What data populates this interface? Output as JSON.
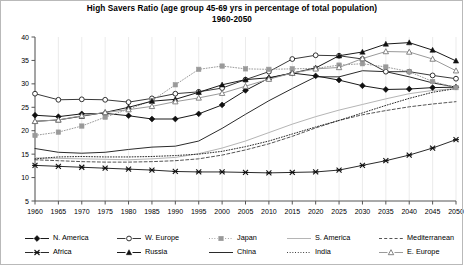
{
  "chart": {
    "title_line1": "High Savers Ratio (age group 45-69 yrs in percentage of total population)",
    "title_line2": "1960-2050"
  },
  "chart_data": {
    "type": "line",
    "title": "High Savers Ratio (age group 45-69 yrs in percentage of total population) 1960-2050",
    "xlabel": "",
    "ylabel": "",
    "xlim": [
      1960,
      2050
    ],
    "ylim": [
      5,
      40
    ],
    "yticks": [
      5,
      10,
      15,
      20,
      25,
      30,
      35,
      40
    ],
    "grid": true,
    "legend_position": "bottom",
    "categories": [
      1960,
      1965,
      1970,
      1975,
      1980,
      1985,
      1990,
      1995,
      2000,
      2005,
      2010,
      2015,
      2020,
      2025,
      2030,
      2035,
      2040,
      2045,
      2050
    ],
    "x": [
      1960,
      1965,
      1970,
      1975,
      1980,
      1985,
      1990,
      1995,
      2000,
      2005,
      2010,
      2015,
      2020,
      2025,
      2030,
      2035,
      2040,
      2045,
      2050
    ],
    "series": [
      {
        "name": "N. America",
        "marker": "filled-diamond",
        "color": "#1a1a1a",
        "style": "solid",
        "values": [
          23.3,
          23.0,
          23.6,
          23.7,
          23.2,
          22.5,
          22.5,
          23.6,
          25.5,
          28.6,
          31.2,
          32.3,
          31.7,
          30.8,
          29.6,
          28.8,
          28.9,
          29.2,
          29.3
        ]
      },
      {
        "name": "W. Europe",
        "marker": "open-circle",
        "color": "#3a3a3a",
        "style": "solid",
        "values": [
          27.9,
          26.6,
          26.7,
          26.6,
          26.1,
          26.9,
          27.9,
          28.3,
          29.1,
          30.9,
          32.6,
          35.3,
          36.1,
          36.0,
          35.3,
          32.6,
          32.6,
          31.8,
          31.1
        ]
      },
      {
        "name": "Japan",
        "marker": "filled-square",
        "color": "#9a9a9a",
        "style": "dotted",
        "values": [
          19.0,
          19.7,
          21.0,
          22.9,
          24.6,
          26.4,
          29.8,
          33.1,
          33.8,
          33.2,
          33.1,
          33.2,
          33.3,
          34.0,
          34.3,
          33.6,
          32.6,
          30.5,
          29.2
        ]
      },
      {
        "name": "S. America",
        "marker": "none",
        "color": "#b5b5b5",
        "style": "solid",
        "values": [
          14.2,
          14.1,
          14.0,
          13.9,
          13.8,
          14.0,
          14.3,
          15.1,
          16.3,
          17.8,
          19.6,
          21.4,
          23.0,
          24.4,
          25.6,
          26.8,
          27.9,
          28.6,
          29.0
        ]
      },
      {
        "name": "Mediterranean",
        "marker": "none",
        "color": "#555555",
        "style": "dashed",
        "values": [
          13.8,
          13.6,
          13.4,
          13.3,
          13.3,
          13.4,
          13.6,
          14.0,
          14.8,
          15.9,
          17.2,
          18.8,
          20.6,
          22.2,
          23.4,
          24.3,
          25.1,
          25.7,
          26.2
        ]
      },
      {
        "name": "Africa",
        "marker": "cross-x",
        "color": "#2b2b2b",
        "style": "solid",
        "values": [
          12.6,
          12.4,
          12.2,
          12.0,
          11.8,
          11.6,
          11.3,
          11.2,
          11.2,
          11.1,
          11.0,
          11.1,
          11.2,
          11.6,
          12.6,
          13.6,
          14.8,
          16.3,
          18.1
        ]
      },
      {
        "name": "Russia",
        "marker": "filled-triangle",
        "color": "#1a1a1a",
        "style": "solid",
        "values": [
          22.0,
          22.3,
          23.1,
          23.9,
          25.0,
          26.3,
          26.7,
          28.2,
          29.8,
          30.9,
          31.3,
          32.3,
          33.4,
          36.0,
          36.8,
          38.5,
          38.8,
          37.2,
          34.9
        ]
      },
      {
        "name": "China",
        "marker": "none",
        "color": "#2b2b2b",
        "style": "solid",
        "values": [
          16.2,
          15.4,
          15.2,
          15.4,
          16.0,
          16.5,
          16.7,
          17.8,
          20.5,
          23.5,
          26.4,
          29.0,
          31.5,
          31.5,
          32.8,
          32.6,
          31.5,
          30.2,
          29.3
        ]
      },
      {
        "name": "India",
        "marker": "none",
        "color": "#2b2b2b",
        "style": "dotted",
        "values": [
          14.0,
          14.4,
          14.5,
          14.4,
          14.4,
          14.5,
          14.7,
          15.0,
          15.6,
          16.6,
          17.8,
          19.3,
          20.8,
          22.2,
          23.8,
          25.4,
          26.9,
          28.2,
          29.0
        ]
      },
      {
        "name": "E. Europe",
        "marker": "open-triangle",
        "color": "#9a9a9a",
        "style": "solid",
        "values": [
          22.0,
          22.3,
          23.2,
          23.9,
          24.5,
          25.2,
          26.2,
          27.0,
          28.0,
          29.5,
          31.0,
          32.3,
          33.2,
          33.5,
          35.4,
          36.9,
          36.8,
          35.3,
          32.8
        ]
      }
    ]
  },
  "axes": {
    "ytick_labels": [
      "40",
      "35",
      "30",
      "25",
      "20",
      "15",
      "10",
      "5"
    ],
    "xtick_labels": [
      "1960",
      "1965",
      "1970",
      "1975",
      "1980",
      "1985",
      "1990",
      "1995",
      "2000",
      "2005",
      "2010",
      "2015",
      "2020",
      "2025",
      "2030",
      "2035",
      "2040",
      "2045",
      "2050"
    ]
  },
  "legend": {
    "items": [
      {
        "label": "N. America",
        "marker": "filled-diamond",
        "color": "#1a1a1a",
        "style": "solid"
      },
      {
        "label": "W. Europe",
        "marker": "open-circle",
        "color": "#3a3a3a",
        "style": "solid"
      },
      {
        "label": "Japan",
        "marker": "filled-square",
        "color": "#9a9a9a",
        "style": "dotted"
      },
      {
        "label": "S. America",
        "marker": "none",
        "color": "#b5b5b5",
        "style": "solid"
      },
      {
        "label": "Mediterranean",
        "marker": "none",
        "color": "#555555",
        "style": "dashed"
      },
      {
        "label": "Africa",
        "marker": "cross-x",
        "color": "#2b2b2b",
        "style": "solid"
      },
      {
        "label": "Russia",
        "marker": "filled-triangle",
        "color": "#1a1a1a",
        "style": "solid"
      },
      {
        "label": "China",
        "marker": "none",
        "color": "#2b2b2b",
        "style": "solid"
      },
      {
        "label": "India",
        "marker": "none",
        "color": "#2b2b2b",
        "style": "dotted"
      },
      {
        "label": "E. Europe",
        "marker": "open-triangle",
        "color": "#9a9a9a",
        "style": "solid"
      }
    ]
  }
}
